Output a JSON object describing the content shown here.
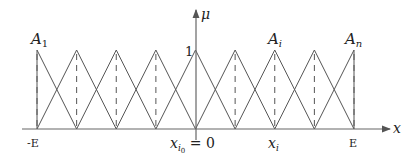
{
  "diagram": {
    "y_axis_label": "μ",
    "x_axis_label": "x",
    "peak_value_label": "1",
    "set_labels": [
      {
        "base": "A",
        "sub": "1",
        "index": 0
      },
      {
        "base": "A",
        "sub": "i",
        "index": 6
      },
      {
        "base": "A",
        "sub": "n",
        "index": 8
      }
    ],
    "x_tick_labels": [
      {
        "text": "-E",
        "index": 0
      },
      {
        "text": "x_{i0} = 0",
        "index": 4
      },
      {
        "text": "x_i",
        "index": 6
      },
      {
        "text": "E",
        "index": 8
      }
    ],
    "num_centers": 9,
    "colors": {
      "line": "#555555",
      "axis": "#666666",
      "text": "#222222"
    }
  }
}
